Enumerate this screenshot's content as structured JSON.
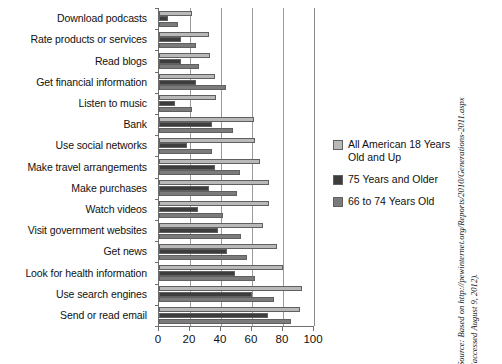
{
  "chart_data": {
    "type": "bar",
    "orientation": "horizontal",
    "title": "",
    "xlabel": "",
    "ylabel": "",
    "xlim": [
      0,
      100
    ],
    "xticks": [
      0,
      20,
      40,
      60,
      80,
      100
    ],
    "grid": true,
    "legend_position": "right",
    "categories": [
      "Download podcasts",
      "Rate products or services",
      "Read blogs",
      "Get financial information",
      "Listen to music",
      "Bank",
      "Use social networks",
      "Make travel arrangements",
      "Make purchases",
      "Watch videos",
      "Visit government websites",
      "Get news",
      "Look for health information",
      "Use search engines",
      "Send or read email"
    ],
    "series": [
      {
        "name": "All American 18 Years Old and Up",
        "color": "#b9b9b9",
        "values": [
          21,
          32,
          33,
          36,
          37,
          61,
          62,
          65,
          71,
          71,
          67,
          76,
          80,
          92,
          91
        ]
      },
      {
        "name": "75 Years and Older",
        "color": "#3d3d3d",
        "values": [
          6,
          14,
          14,
          24,
          10,
          34,
          18,
          36,
          32,
          25,
          38,
          44,
          49,
          60,
          70
        ]
      },
      {
        "name": "66 to 74 Years Old",
        "color": "#7b7b7b",
        "values": [
          12,
          24,
          26,
          43,
          21,
          48,
          34,
          52,
          50,
          41,
          53,
          57,
          62,
          74,
          85
        ]
      }
    ]
  },
  "legend": {
    "items": [
      {
        "label": "All American 18 Years Old and Up",
        "swatch": "s-all"
      },
      {
        "label": "75 Years and Older",
        "swatch": "s-75"
      },
      {
        "label": "66 to 74 Years Old",
        "swatch": "s-66"
      }
    ]
  },
  "source_note": {
    "line1": "Source: Based on http://pewinternet.org/Reports/2010/Generations-2011.aspx",
    "line2": "(accessed August 9, 2012)."
  }
}
